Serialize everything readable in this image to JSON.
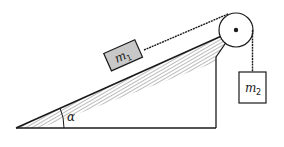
{
  "diagram": {
    "type": "physics-incline-pulley",
    "labels": {
      "mass1": "m",
      "mass1_sub": "1",
      "mass2": "m",
      "mass2_sub": "2",
      "angle": "α"
    },
    "colors": {
      "stroke": "#1a1a1a",
      "block1_fill": "#c8c8c8",
      "block2_fill": "#ffffff",
      "hatch": "#555555"
    }
  }
}
